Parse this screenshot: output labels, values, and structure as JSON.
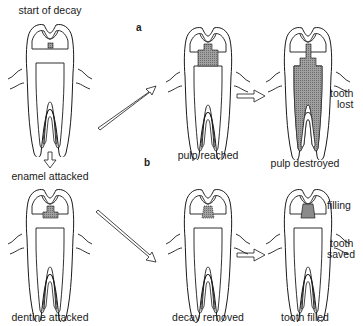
{
  "diagram": {
    "section_labels": {
      "a": "a",
      "b": "b"
    },
    "stages": [
      {
        "id": "start",
        "label": "start of decay"
      },
      {
        "id": "enamel",
        "label": "enamel attacked"
      },
      {
        "id": "dentine",
        "label": "dentine attacked"
      },
      {
        "id": "pulp_reached",
        "label": "pulp reached"
      },
      {
        "id": "pulp_destroyed",
        "label": "pulp destroyed"
      },
      {
        "id": "decay_removed",
        "label": "decay removed"
      },
      {
        "id": "tooth_filled",
        "label": "tooth filled"
      }
    ],
    "outcomes": {
      "lost_line1": "tooth",
      "lost_line2": "lost",
      "saved_line1": "tooth",
      "saved_line2": "saved"
    },
    "annotations": {
      "filling": "filling"
    },
    "colors": {
      "line": "#1a1a1a",
      "decay_fill": "#8c8c8c",
      "background": "#ffffff"
    }
  }
}
